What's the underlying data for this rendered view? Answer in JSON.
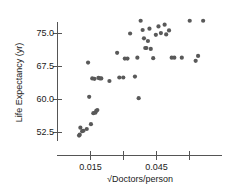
{
  "chart_data": {
    "type": "scatter",
    "title": "",
    "xlabel": "√Doctors/person",
    "ylabel": "Life Expectancy (yr)",
    "xlim": [
      0.0045,
      0.0705
    ],
    "ylim": [
      49.0,
      79.5
    ],
    "grid": false,
    "legend": null,
    "marker_color": "#595959",
    "marker_size_px": 4.2,
    "axis_color": "#555555",
    "xticks": [
      0.015,
      0.03,
      0.045,
      0.06
    ],
    "xtick_labels": [
      "0.015",
      "",
      "0.045",
      ""
    ],
    "yticks": [
      52.5,
      60.0,
      67.5,
      75.0
    ],
    "ytick_labels": [
      "52.5",
      "60.0",
      "67.5",
      "75.0"
    ],
    "x": [
      0.0098,
      0.0101,
      0.0104,
      0.0112,
      0.0118,
      0.0133,
      0.0152,
      0.0163,
      0.0172,
      0.0176,
      0.0181,
      0.0139,
      0.0144,
      0.0186,
      0.0193,
      0.0199,
      0.0236,
      0.0271,
      0.0281,
      0.0299,
      0.0306,
      0.0318,
      0.033,
      0.0352,
      0.0363,
      0.0369,
      0.0378,
      0.0387,
      0.0393,
      0.0399,
      0.0404,
      0.0411,
      0.0418,
      0.0424,
      0.0435,
      0.0447,
      0.0459,
      0.047,
      0.0487,
      0.0494,
      0.0507,
      0.0519,
      0.0531,
      0.0565,
      0.0601,
      0.0628,
      0.0639,
      0.0662,
      0.0158,
      0.0168
    ],
    "y": [
      51.8,
      52.0,
      53.6,
      52.8,
      52.9,
      53.3,
      54.4,
      56.9,
      57.0,
      57.4,
      57.6,
      68.4,
      60.6,
      64.9,
      64.8,
      64.8,
      64.2,
      70.6,
      65.0,
      65.0,
      69.3,
      69.3,
      75.0,
      65.2,
      69.5,
      60.3,
      77.9,
      75.8,
      73.9,
      71.7,
      71.7,
      73.3,
      76.1,
      71.5,
      69.4,
      74.7,
      76.6,
      75.1,
      77.0,
      74.8,
      75.7,
      69.5,
      69.5,
      69.5,
      77.9,
      68.8,
      69.9,
      77.9,
      64.8,
      64.7
    ]
  }
}
